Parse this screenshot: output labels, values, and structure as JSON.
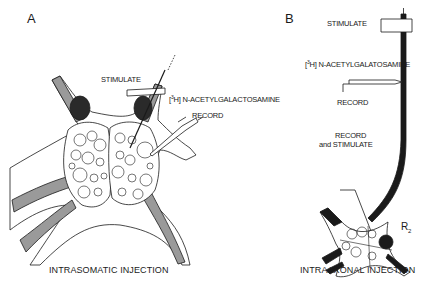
{
  "panels": {
    "A": {
      "letter": "A",
      "labels": {
        "stimulate": "STIMULATE",
        "injection_sup": "3",
        "injection_pre": "[",
        "injection_post": "H] N-ACETYLGALACTOSAMINE",
        "record": "RECORD"
      },
      "caption": "INTRASOMATIC INJECTION"
    },
    "B": {
      "letter": "B",
      "labels": {
        "stimulate": "STIMULATE",
        "injection_sup": "3",
        "injection_pre": "[",
        "injection_post": "H] N-ACETYLGALATOSAMINE",
        "record": "RECORD",
        "record_and_stimulate_line1": "RECORD",
        "record_and_stimulate_line2": "and STIMULATE",
        "neuron_label": "R",
        "neuron_label_sub": "2"
      },
      "caption": "INTRAAXONAL INJECTION"
    }
  },
  "colors": {
    "ink": "#1a1a1a",
    "nerve_fill": "#9a9a9a",
    "background": "#ffffff"
  }
}
